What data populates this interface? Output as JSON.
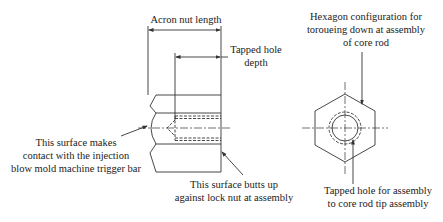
{
  "diagram": {
    "type": "technical-drawing",
    "labels": {
      "nut_length": "Acron nut length",
      "tapped_depth_line1": "Tapped hole",
      "tapped_depth_line2": "depth",
      "contact_line1": "This surface makes",
      "contact_line2": "contact with the injection",
      "contact_line3": "blow mold machine trigger bar",
      "butts_line1": "This surface butts up",
      "butts_line2": "against lock nut at assembly",
      "hex_line1": "Hexagon configuration for",
      "hex_line2": "toroueing down at assembly",
      "hex_line3": "of core rod",
      "tapped_hole_line1": "Tapped hole for assembly",
      "tapped_hole_line2": "to core rod tip assembly"
    },
    "colors": {
      "line": "#333333",
      "background": "#ffffff"
    }
  }
}
